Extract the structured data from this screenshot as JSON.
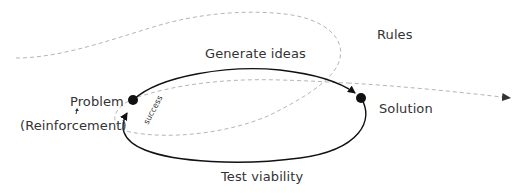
{
  "diagram": {
    "labels": {
      "rules": "Rules",
      "generate": "Generate ideas",
      "problem": "Problem",
      "reinforcement": "(Reinforcement)",
      "solution": "Solution",
      "test": "Test viability",
      "success": "success"
    },
    "colors": {
      "solid": "#111111",
      "dashed": "#b0b0b0",
      "text": "#333333"
    },
    "nodes": [
      {
        "id": "problem",
        "x": 133,
        "y": 100
      },
      {
        "id": "solution",
        "x": 361,
        "y": 98
      }
    ]
  }
}
